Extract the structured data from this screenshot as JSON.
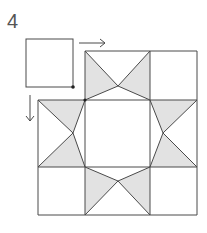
{
  "step_number": "4",
  "colors": {
    "stroke": "#4a4a4a",
    "shade": "#e2e2e2",
    "background": "#ffffff"
  },
  "diagram": {
    "grid_columns_x": [
      38,
      85,
      150,
      197
    ],
    "grid_rows_y": [
      51,
      100,
      167,
      215
    ],
    "apex_points": {
      "top": [
        118,
        86
      ],
      "left": [
        73,
        133
      ],
      "right": [
        163,
        133
      ],
      "bottom": [
        118,
        181
      ]
    },
    "offset_square": {
      "x": 26,
      "y": 39,
      "w": 47,
      "h": 48,
      "dot": [
        73,
        87
      ]
    },
    "arrows": [
      {
        "name": "right-arrow",
        "from": [
          79,
          43
        ],
        "to": [
          105,
          43
        ]
      },
      {
        "name": "down-arrow",
        "from": [
          30,
          95
        ],
        "to": [
          30,
          121
        ]
      }
    ]
  }
}
